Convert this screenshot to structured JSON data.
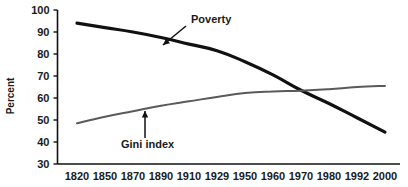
{
  "chart_data": {
    "type": "line",
    "title": "",
    "subtitle": "",
    "xlabel": "",
    "ylabel": "Percent",
    "ylim": [
      30,
      100
    ],
    "ytick_labels": [
      "30",
      "40",
      "50",
      "60",
      "70",
      "80",
      "90",
      "100"
    ],
    "ytick_values": [
      30,
      40,
      50,
      60,
      70,
      80,
      90,
      100
    ],
    "categories": [
      "1820",
      "1850",
      "1870",
      "1890",
      "1910",
      "1929",
      "1950",
      "1960",
      "1970",
      "1980",
      "1992",
      "2000"
    ],
    "x_values": [
      1820,
      1850,
      1870,
      1890,
      1910,
      1929,
      1950,
      1960,
      1970,
      1980,
      1992,
      2000
    ],
    "grid": false,
    "legend": "annotations",
    "series": [
      {
        "name": "Poverty",
        "color": "#111111",
        "width": 3.2,
        "values": [
          94,
          92,
          90,
          87.5,
          84.5,
          81.5,
          76.5,
          70.5,
          63.5,
          57.5,
          51,
          44.5
        ]
      },
      {
        "name": "Gini index",
        "color": "#5a5a5a",
        "width": 2.0,
        "values": [
          48.5,
          51.5,
          54,
          56.5,
          58.5,
          60.5,
          62.3,
          63,
          63.3,
          64,
          65,
          65.5
        ]
      }
    ],
    "annotations": [
      {
        "label": "Poverty",
        "series": "Poverty",
        "text_x": 191,
        "text_y": 23,
        "arrow_from_x": 186,
        "arrow_from_y": 26,
        "arrow_to_x": 163,
        "arrow_to_y": 45
      },
      {
        "label": "Gini index",
        "series": "Gini index",
        "text_x": 121,
        "text_y": 148,
        "arrow_from_x": 145,
        "arrow_from_y": 138,
        "arrow_to_x": 145,
        "arrow_to_y": 111
      }
    ]
  },
  "axis": {
    "y_title": "Percent"
  }
}
